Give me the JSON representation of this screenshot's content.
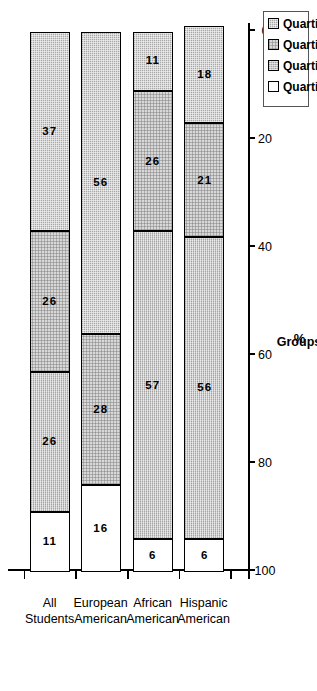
{
  "chart_data": {
    "type": "bar",
    "title": "",
    "subtitle": "",
    "orientation": "vertical-stacked-percent",
    "xlabel": "Groups",
    "ylabel": "%",
    "ylim": [
      0,
      100
    ],
    "ytick_labels": [
      "0",
      "20",
      "40",
      "60",
      "80",
      "100"
    ],
    "ytick_values": [
      0,
      20,
      40,
      60,
      80,
      100
    ],
    "grid": false,
    "legend_position": "top-right",
    "categories": [
      "All Students",
      "European American",
      "African American",
      "Hispanic American"
    ],
    "category_lines": [
      [
        "All",
        "Students"
      ],
      [
        "European",
        "American"
      ],
      [
        "African",
        "American"
      ],
      [
        "Hispanic",
        "American"
      ]
    ],
    "series": [
      {
        "name": "Quartile 1",
        "fill": "q1",
        "values": [
          11,
          16,
          6,
          6
        ]
      },
      {
        "name": "Quartile 2",
        "fill": "q2",
        "values": [
          26,
          0,
          57,
          56
        ]
      },
      {
        "name": "Quartile 3",
        "fill": "q3",
        "values": [
          26,
          28,
          26,
          21
        ]
      },
      {
        "name": "Quartile 4",
        "fill": "q4",
        "values": [
          37,
          56,
          11,
          18
        ]
      }
    ],
    "stacks": [
      {
        "category": "All Students",
        "segments": [
          {
            "series": "Quartile 1",
            "fill": "q1",
            "value": 11,
            "label": "11"
          },
          {
            "series": "Quartile 2",
            "fill": "q2",
            "value": 26,
            "label": "26"
          },
          {
            "series": "Quartile 3",
            "fill": "q3",
            "value": 26,
            "label": "26"
          },
          {
            "series": "Quartile 4",
            "fill": "q4",
            "value": 37,
            "label": "37"
          }
        ]
      },
      {
        "category": "European American",
        "segments": [
          {
            "series": "Quartile 1",
            "fill": "q1",
            "value": 16,
            "label": "16"
          },
          {
            "series": "Quartile 3",
            "fill": "q3",
            "value": 28,
            "label": "28"
          },
          {
            "series": "Quartile 4",
            "fill": "q4",
            "value": 56,
            "label": "56"
          }
        ]
      },
      {
        "category": "African American",
        "segments": [
          {
            "series": "Quartile 1",
            "fill": "q1",
            "value": 6,
            "label": "6"
          },
          {
            "series": "Quartile 2",
            "fill": "q2",
            "value": 57,
            "label": "57"
          },
          {
            "series": "Quartile 3",
            "fill": "q3",
            "value": 26,
            "label": "26"
          },
          {
            "series": "Quartile 4",
            "fill": "q4",
            "value": 11,
            "label": "11"
          }
        ]
      },
      {
        "category": "Hispanic American",
        "segments": [
          {
            "series": "Quartile 1",
            "fill": "q1",
            "value": 6,
            "label": "6"
          },
          {
            "series": "Quartile 2",
            "fill": "q2",
            "value": 56,
            "label": "56"
          },
          {
            "series": "Quartile 3",
            "fill": "q3",
            "value": 21,
            "label": "21"
          },
          {
            "series": "Quartile 4",
            "fill": "q4",
            "value": 18,
            "label": "18"
          }
        ]
      }
    ],
    "colors": {
      "q4": "#a8a8a8",
      "q3": "#d8d8d8",
      "q2": "#c4c4c4",
      "q1": "#ffffff",
      "axis": "#000000",
      "text": "#000000",
      "background": "#ffffff"
    }
  },
  "legend": {
    "items": [
      {
        "label": "Quartile 4",
        "fill": "q4"
      },
      {
        "label": "Quartile 3",
        "fill": "q3"
      },
      {
        "label": "Quartile 2",
        "fill": "q2"
      },
      {
        "label": "Quartile 1",
        "fill": "q1"
      }
    ]
  },
  "axes": {
    "y_title": "%",
    "x_title": "Groups"
  }
}
